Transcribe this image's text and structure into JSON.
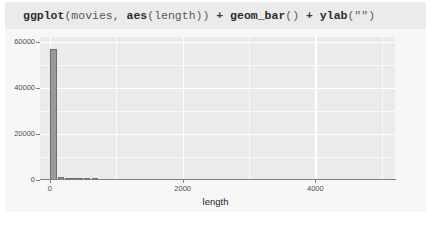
{
  "card": {
    "code": {
      "tokens": [
        {
          "t": "ggplot",
          "k": "fn"
        },
        {
          "t": "(",
          "k": "arg"
        },
        {
          "t": "movies, ",
          "k": "arg"
        },
        {
          "t": "aes",
          "k": "fn"
        },
        {
          "t": "(length))",
          "k": "arg"
        },
        {
          "t": " + ",
          "k": "op"
        },
        {
          "t": "geom_bar",
          "k": "fn"
        },
        {
          "t": "()",
          "k": "arg"
        },
        {
          "t": " + ",
          "k": "op"
        },
        {
          "t": "ylab",
          "k": "fn"
        },
        {
          "t": "(\"\")",
          "k": "str"
        }
      ],
      "full_text": "ggplot(movies, aes(length)) + geom_bar() + ylab(\"\")"
    }
  },
  "chart_data": {
    "type": "bar",
    "title": "",
    "xlabel": "length",
    "ylabel": "",
    "xlim": [
      -150,
      5200
    ],
    "ylim": [
      0,
      62000
    ],
    "xticks": [
      0,
      2000,
      4000
    ],
    "xtick_labels": [
      "0",
      "2000",
      "4000"
    ],
    "yticks": [
      0,
      20000,
      40000,
      60000
    ],
    "ytick_labels": [
      "0",
      "20000",
      "40000",
      "60000"
    ],
    "x_minor_ticks": [
      1000,
      3000,
      5000
    ],
    "y_minor_ticks": [
      10000,
      30000,
      50000
    ],
    "grid": true,
    "legend": "none",
    "theme": "theme_grey",
    "bar_fill": "#9a9a9a",
    "bar_outline": "#6e6e6e",
    "panel_background": "#ebebeb",
    "gridline_color": "#ffffff",
    "bars": [
      {
        "x": 55,
        "width": 110,
        "value": 57000
      },
      {
        "x": 170,
        "width": 90,
        "value": 1400
      },
      {
        "x": 265,
        "width": 90,
        "value": 500
      },
      {
        "x": 360,
        "width": 90,
        "value": 200
      },
      {
        "x": 455,
        "width": 90,
        "value": 120
      },
      {
        "x": 560,
        "width": 90,
        "value": 60
      },
      {
        "x": 680,
        "width": 90,
        "value": 30
      }
    ]
  }
}
